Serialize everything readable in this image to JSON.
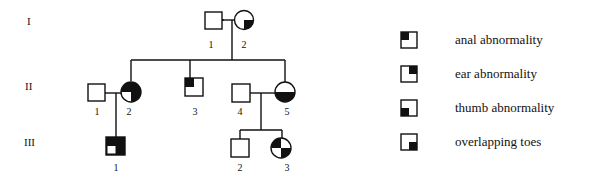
{
  "generations": [
    {
      "label": "I",
      "y": 22
    },
    {
      "label": "II",
      "y": 87
    },
    {
      "label": "III",
      "y": 143
    }
  ],
  "individuals": {
    "I1": {
      "number": "1",
      "sex": "male",
      "affected": []
    },
    "I2": {
      "number": "2",
      "sex": "female",
      "affected": [
        "overlapping toes"
      ]
    },
    "II1": {
      "number": "1",
      "sex": "male",
      "affected": []
    },
    "II2": {
      "number": "2",
      "sex": "female",
      "affected": [
        "anal abnormality",
        "ear abnormality",
        "overlapping toes"
      ]
    },
    "II3": {
      "number": "3",
      "sex": "male",
      "affected": [
        "anal abnormality"
      ]
    },
    "II4": {
      "number": "4",
      "sex": "male",
      "affected": []
    },
    "II5": {
      "number": "5",
      "sex": "female",
      "affected": [
        "thumb abnormality",
        "overlapping toes"
      ]
    },
    "III1": {
      "number": "1",
      "sex": "male",
      "affected": [
        "anal abnormality",
        "ear abnormality",
        "overlapping toes"
      ]
    },
    "III2": {
      "number": "2",
      "sex": "male",
      "affected": []
    },
    "III3": {
      "number": "3",
      "sex": "female",
      "affected": [
        "anal abnormality",
        "overlapping toes"
      ]
    }
  },
  "legend": [
    {
      "label": "anal abnormality",
      "quadrant": "top-left"
    },
    {
      "label": "ear abnormality",
      "quadrant": "top-right"
    },
    {
      "label": "thumb abnormality",
      "quadrant": "bottom-left"
    },
    {
      "label": "overlapping toes",
      "quadrant": "bottom-right"
    }
  ],
  "colors": {
    "line": "#111111",
    "fill": "#111111",
    "background": "#ffffff"
  }
}
